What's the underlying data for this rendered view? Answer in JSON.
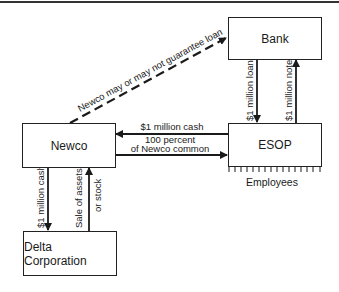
{
  "diagram": {
    "nodes": {
      "bank": "Bank",
      "newco": "Newco",
      "esop": "ESOP",
      "delta": "Delta Corporation",
      "employees": "Employees"
    },
    "edges": {
      "guarantee": "Newco may or may not guarantee loan",
      "bank_loan": "$1 million loan",
      "esop_note": "$1 million note",
      "esop_cash": "$1 million cash",
      "common_line1": "100 percent",
      "common_line2": "of Newco common",
      "newco_cash": "$1 million cash",
      "sale_line1": "Sale of assets",
      "sale_line2": "or stock"
    }
  }
}
